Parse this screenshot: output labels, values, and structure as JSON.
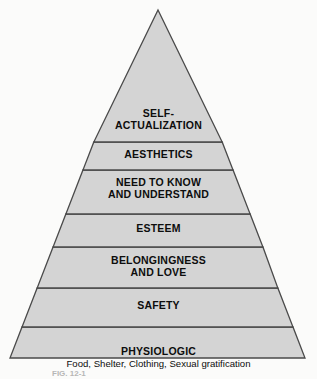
{
  "figure": {
    "background_color": "#fbfbfa",
    "tier_fill_color": "#d4d4d4",
    "outline_color": "#4a4a4a",
    "text_color": "#0d0d0d"
  },
  "pyramid": {
    "apex": {
      "x": 158,
      "y": 10
    },
    "base_left": {
      "x": 10,
      "y": 358
    },
    "base_right": {
      "x": 305,
      "y": 358
    },
    "divider_y": [
      142,
      170,
      214,
      247,
      288,
      327
    ],
    "tiers": [
      {
        "index": 1,
        "name": "self-actualization",
        "label": "SELF-\nACTUALIZATION",
        "subtitle": "",
        "top_y": 10,
        "bottom_y": 142
      },
      {
        "index": 2,
        "name": "aesthetics",
        "label": "AESTHETICS",
        "subtitle": "",
        "top_y": 142,
        "bottom_y": 170
      },
      {
        "index": 3,
        "name": "need-to-know-and-understand",
        "label": "NEED TO KNOW\nAND UNDERSTAND",
        "subtitle": "",
        "top_y": 170,
        "bottom_y": 214
      },
      {
        "index": 4,
        "name": "esteem",
        "label": "ESTEEM",
        "subtitle": "",
        "top_y": 214,
        "bottom_y": 247
      },
      {
        "index": 5,
        "name": "belongingness-and-love",
        "label": "BELONGINGNESS\nAND LOVE",
        "subtitle": "",
        "top_y": 247,
        "bottom_y": 288
      },
      {
        "index": 6,
        "name": "safety",
        "label": "SAFETY",
        "subtitle": "",
        "top_y": 288,
        "bottom_y": 327
      },
      {
        "index": 7,
        "name": "physiologic",
        "label": "PHYSIOLOGIC",
        "subtitle": "Food, Shelter, Clothing, Sexual gratification",
        "top_y": 327,
        "bottom_y": 358
      }
    ]
  },
  "caption": {
    "text": "FIG. 12-1",
    "note": "partially cropped at bottom edge of image"
  }
}
